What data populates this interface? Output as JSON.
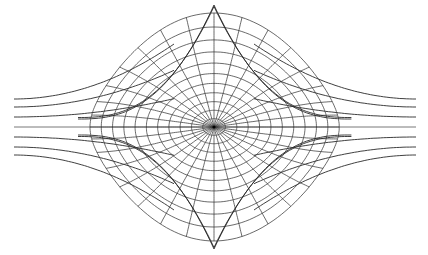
{
  "diagram": {
    "type": "conformal-polar-grid",
    "center": [
      214,
      127
    ],
    "top_cusp": [
      214,
      13
    ],
    "bottom_cusp": [
      214,
      242
    ],
    "left_extent": 14,
    "right_extent": 416,
    "radial_line_count": 32,
    "ring_count": 11,
    "wing_line_count_per_side": 3,
    "colors": {
      "background": "#ffffff",
      "line": "#3a3a3a",
      "center_dot": "#000000"
    }
  }
}
